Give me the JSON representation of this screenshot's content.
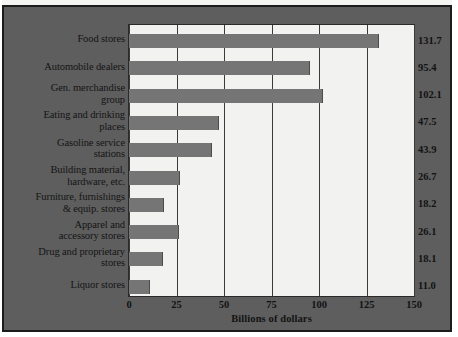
{
  "chart_data": {
    "type": "bar",
    "orientation": "horizontal",
    "title": "",
    "xlabel": "Billions of dollars",
    "ylabel": "",
    "xlim": [
      0,
      150
    ],
    "xticks": [
      0,
      25,
      50,
      75,
      100,
      125,
      150
    ],
    "xtick_labels": [
      "0",
      "25",
      "50",
      "75",
      "100",
      "125",
      "150"
    ],
    "grid": true,
    "grid_axis": "x",
    "legend": false,
    "value_labels_position": "right-outside",
    "categories": [
      "Food stores",
      "Automobile dealers",
      "Gen. merchandise group",
      "Eating and drinking places",
      "Gasoline service stations",
      "Building material, hardware, etc.",
      "Furniture, furnishings & equip. stores",
      "Apparel and accessory stores",
      "Drug and proprietary stores",
      "Liquor stores"
    ],
    "category_lines": [
      [
        "Food stores",
        ""
      ],
      [
        "Automobile dealers",
        ""
      ],
      [
        "Gen. merchandise",
        "group"
      ],
      [
        "Eating and drinking",
        "places"
      ],
      [
        "Gasoline service",
        "stations"
      ],
      [
        "Building material,",
        "hardware, etc."
      ],
      [
        "Furniture, furnishings",
        "& equip. stores"
      ],
      [
        "Apparel and",
        "accessory stores"
      ],
      [
        "Drug and proprietary",
        "stores"
      ],
      [
        "Liquor stores",
        ""
      ]
    ],
    "values": [
      131.7,
      95.4,
      102.1,
      47.5,
      43.9,
      26.7,
      18.2,
      26.1,
      18.1,
      11.0
    ],
    "value_labels": [
      "131.7",
      "95.4",
      "102.1",
      "47.5",
      "43.9",
      "26.7",
      "18.2",
      "26.1",
      "18.1",
      "11.0"
    ]
  },
  "colors": {
    "panel_background": "#5e5e5e",
    "plot_background": "#f2f2f0",
    "bar_fill": "#757575",
    "gridline": "#3a3a3a",
    "frame": "#1b1b1b",
    "text": "#131313"
  }
}
